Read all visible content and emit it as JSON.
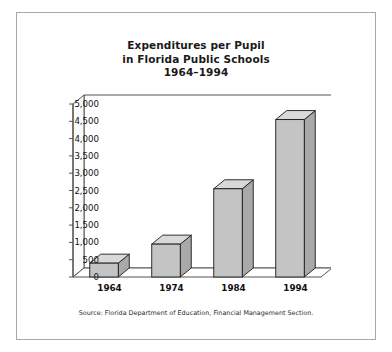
{
  "figure": {
    "title_lines": [
      "Expenditures per Pupil",
      "in Florida Public Schools",
      "1964–1994"
    ],
    "source_note": "Source: Florida Department of Education, Financial Management Section.",
    "frame_color": "#a8a8a8",
    "background_color": "#ffffff"
  },
  "chart_data": {
    "type": "bar",
    "title": "Expenditures per Pupil in Florida Public Schools 1964–1994",
    "subtitle": "",
    "xlabel": "",
    "ylabel": "",
    "categories": [
      "1964",
      "1974",
      "1984",
      "1994"
    ],
    "values": [
      400,
      950,
      2550,
      4550
    ],
    "ylim": [
      0,
      5000
    ],
    "ytick_values": [
      0,
      500,
      1000,
      1500,
      2000,
      2500,
      3000,
      3500,
      4000,
      4500,
      5000
    ],
    "ytick_labels": [
      "0",
      "500",
      "1,000",
      "1,500",
      "2,000",
      "2,500",
      "3,000",
      "3,500",
      "4,000",
      "4,500",
      "5,000"
    ],
    "grid": false,
    "legend": false,
    "legend_position": "none",
    "style": "3d-columns",
    "bar_face_color": "#c4c4c4",
    "bar_top_color": "#d9d9d9",
    "bar_side_color": "#a9a9a9",
    "bar_outline_color": "#1a1a1a",
    "axis_color": "#555555"
  }
}
